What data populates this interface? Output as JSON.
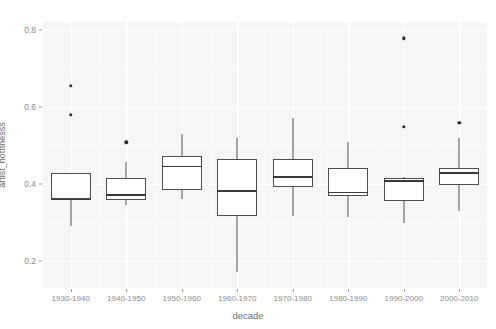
{
  "chart_data": {
    "type": "boxplot",
    "title": "",
    "xlabel": "decade",
    "ylabel": "artist_hotttnesss",
    "ylim": [
      0.13,
      0.82
    ],
    "y_ticks": [
      0.2,
      0.4,
      0.6,
      0.8
    ],
    "y_tick_labels": [
      "0.2",
      "0.4",
      "0.6",
      "0.8"
    ],
    "grid": true,
    "legend": "none",
    "categories": [
      "1930-1940",
      "1940-1950",
      "1950-1960",
      "1960-1970",
      "1970-1980",
      "1980-1990",
      "1990-2000",
      "2000-2010"
    ],
    "boxes": [
      {
        "category": "1930-1940",
        "whisker_low": 0.29,
        "q1": 0.36,
        "median": 0.36,
        "q3": 0.428,
        "whisker_high": 0.428,
        "outliers": [
          0.655,
          0.58
        ]
      },
      {
        "category": "1940-1950",
        "whisker_low": 0.345,
        "q1": 0.358,
        "median": 0.372,
        "q3": 0.415,
        "whisker_high": 0.458,
        "outliers": [
          0.508
        ]
      },
      {
        "category": "1950-1960",
        "whisker_low": 0.36,
        "q1": 0.383,
        "median": 0.445,
        "q3": 0.472,
        "whisker_high": 0.53,
        "outliers": []
      },
      {
        "category": "1960-1970",
        "whisker_low": 0.172,
        "q1": 0.318,
        "median": 0.382,
        "q3": 0.465,
        "whisker_high": 0.518,
        "outliers": []
      },
      {
        "category": "1970-1980",
        "whisker_low": 0.318,
        "q1": 0.392,
        "median": 0.418,
        "q3": 0.465,
        "whisker_high": 0.572,
        "outliers": []
      },
      {
        "category": "1980-1990",
        "whisker_low": 0.315,
        "q1": 0.368,
        "median": 0.378,
        "q3": 0.44,
        "whisker_high": 0.51,
        "outliers": []
      },
      {
        "category": "1990-2000",
        "whisker_low": 0.298,
        "q1": 0.355,
        "median": 0.408,
        "q3": 0.415,
        "whisker_high": 0.418,
        "outliers": [
          0.778,
          0.548
        ]
      },
      {
        "category": "2000-2010",
        "whisker_low": 0.33,
        "q1": 0.398,
        "median": 0.428,
        "q3": 0.44,
        "whisker_high": 0.52,
        "outliers": [
          0.558
        ]
      }
    ]
  },
  "style": {
    "panel_background": "#f6f6f6",
    "grid_color": "#ffffff",
    "box_line_color": "#4d4d4d",
    "box_fill": "#ffffff",
    "outlier_color": "#2b2b2b",
    "axis_text_color": "#8c8c8c",
    "axis_title_color": "#6b6b6b"
  }
}
